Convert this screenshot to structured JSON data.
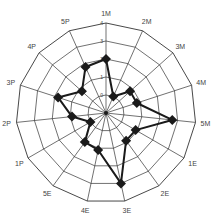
{
  "chart_data": {
    "type": "radar",
    "title": "",
    "categories": [
      "1M",
      "2M",
      "3M",
      "4M",
      "5M",
      "1E",
      "2E",
      "3E",
      "4E",
      "5E",
      "1P",
      "2P",
      "3P",
      "4P",
      "5P"
    ],
    "series": [
      {
        "name": "series-1",
        "values": [
          2.0,
          0.0,
          0.8,
          0.8,
          2.7,
          0.9,
          0.9,
          3.0,
          1.1,
          1.0,
          0.0,
          0.9,
          1.8,
          0.8,
          1.8
        ],
        "color": "#1a1a1a",
        "marker": "diamond"
      }
    ],
    "radial_ticks": [
      "0",
      "1",
      "2",
      "3",
      "4"
    ],
    "rlim": [
      -1,
      4
    ],
    "grid": true,
    "legend": "none"
  },
  "style": {
    "grid_color": "#333333",
    "line_color": "#1a1a1a",
    "background": "#ffffff"
  }
}
